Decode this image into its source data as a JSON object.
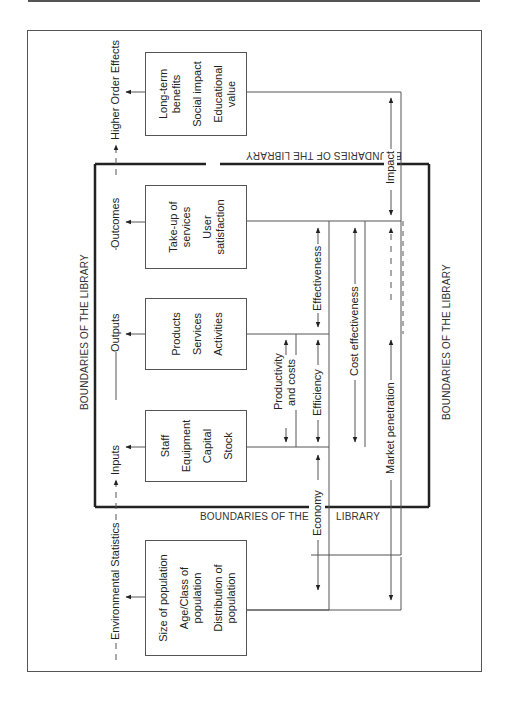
{
  "diagram": {
    "boundaries": {
      "top_left": "BOUNDARIES OF THE LIBRARY",
      "top_upside_down": "BOUNDARIES OF THE LIBRARY",
      "bottom_part1": "BOUNDARIES OF THE",
      "bottom_part2": "LIBRARY",
      "right": "BOUNDARIES OF THE LIBRARY"
    },
    "flow_labels": {
      "environmental": "Environmental Statistics",
      "inputs": "Inputs",
      "outputs": "Outputs",
      "outcomes": "Outcomes",
      "higher_order": "Higher Order Effects"
    },
    "boxes": {
      "population": [
        "Size of population",
        "Age/Class of population",
        "Distribution of population"
      ],
      "inputs": [
        "Staff",
        "Equipment",
        "Capital",
        "Stock"
      ],
      "outputs": [
        "Products",
        "Services",
        "Activities"
      ],
      "outcomes": [
        "Take-up of services",
        "User satisfaction"
      ],
      "higher": [
        "Long-term benefits",
        "Social impact",
        "Educational value"
      ]
    },
    "measures": {
      "productivity": "Productivity and costs",
      "efficiency": "Efficiency",
      "effectiveness": "Effectiveness",
      "cost_effectiveness": "Cost effectiveness",
      "economy": "Economy",
      "market_penetration": "Market penetration",
      "impact": "Impact"
    }
  }
}
